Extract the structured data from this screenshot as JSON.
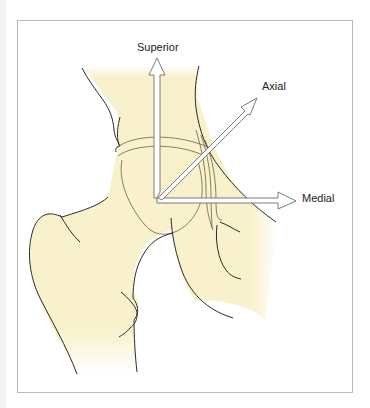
{
  "figure": {
    "labels": {
      "superior": "Superior",
      "axial": "Axial",
      "medial": "Medial"
    },
    "colors": {
      "bone_fill": "#f8f1cc",
      "outline": "#2a2a2a",
      "fine_line": "#6b6148",
      "arrow_stroke": "#6e6e6e",
      "arrow_fill": "#ffffff",
      "frame_border": "#b8b8b8"
    },
    "axes": [
      {
        "name": "Superior",
        "direction": "up"
      },
      {
        "name": "Axial",
        "direction": "up-right diagonal"
      },
      {
        "name": "Medial",
        "direction": "right"
      }
    ]
  }
}
